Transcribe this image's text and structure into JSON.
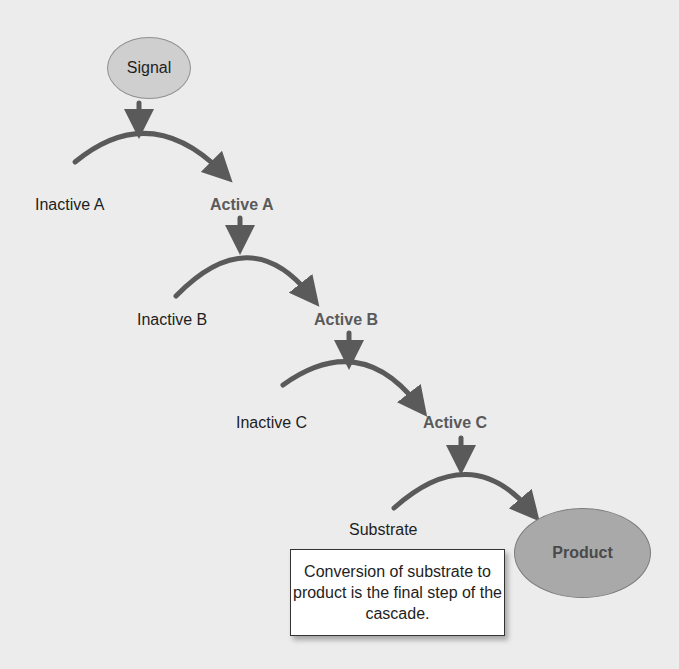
{
  "diagram": {
    "signal": "Signal",
    "steps": [
      {
        "inactive": "Inactive A",
        "active": "Active A"
      },
      {
        "inactive": "Inactive B",
        "active": "Active B"
      },
      {
        "inactive": "Inactive C",
        "active": "Active C"
      },
      {
        "inactive": "Substrate",
        "active": "Product"
      }
    ],
    "note": "Conversion of substrate to product is the final step of the cascade.",
    "colors": {
      "background": "#ececec",
      "arrow": "#5a5a5a",
      "signal_fill": "#cfcfcf",
      "product_fill": "#a9a9a9",
      "active_text": "#5a5a5a"
    }
  }
}
